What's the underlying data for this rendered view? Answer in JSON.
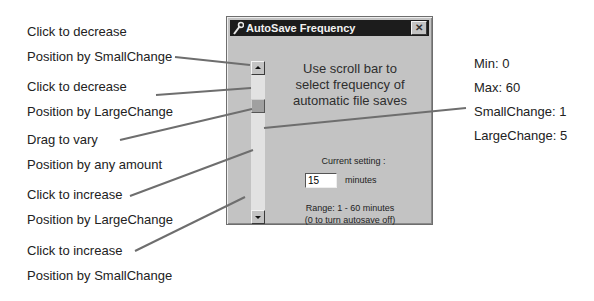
{
  "annotations": {
    "left": [
      {
        "line1": "Click to decrease",
        "line2": "Position by SmallChange"
      },
      {
        "line1": "Click to decrease",
        "line2": "Position by LargeChange"
      },
      {
        "line1": "Drag to vary",
        "line2": "Position by any amount"
      },
      {
        "line1": "Click to increase",
        "line2": "Position by LargeChange"
      },
      {
        "line1": "Click to increase",
        "line2": "Position by SmallChange"
      }
    ],
    "properties": [
      "Min: 0",
      "Max: 60",
      "SmallChange: 1",
      "LargeChange: 5"
    ]
  },
  "dialog": {
    "title": "AutoSave Frequency",
    "close_label": "✕",
    "instruction_line1": "Use scroll bar to",
    "instruction_line2": "select frequency of",
    "instruction_line3": "automatic file saves",
    "current_setting_label": "Current setting :",
    "value": "15",
    "unit": "minutes",
    "range_line1": "Range: 1 - 60 minutes",
    "range_line2": "(0 to turn autosave off)"
  },
  "colors": {
    "dialog_bg": "#c3c3c3",
    "titlebar_bg": "#1c1c1c",
    "scroll_track": "#e2e2e2",
    "leader_line": "#6e6e6e"
  }
}
